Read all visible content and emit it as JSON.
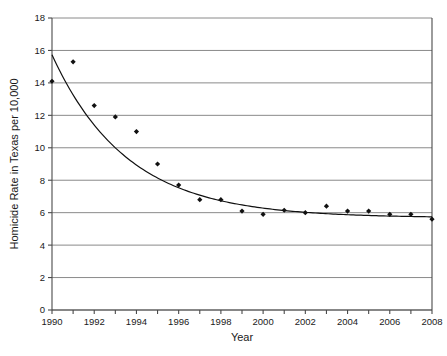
{
  "chart_data": {
    "type": "scatter",
    "title": "",
    "xlabel": "Year",
    "ylabel": "Homicide Rate in Texas per 10,000",
    "xlim": [
      1990,
      2008
    ],
    "ylim": [
      0,
      18
    ],
    "ytick_step": 2,
    "xtick_label_step": 2,
    "xtick_step": 1,
    "grid": "horizontal",
    "legend": "none",
    "x": [
      1990,
      1991,
      1992,
      1993,
      1994,
      1995,
      1996,
      1997,
      1998,
      1999,
      2000,
      2001,
      2002,
      2003,
      2004,
      2005,
      2006,
      2007,
      2008
    ],
    "values": [
      14.1,
      15.3,
      12.6,
      11.9,
      11.0,
      9.0,
      7.7,
      6.8,
      6.8,
      6.1,
      5.9,
      6.15,
      6.0,
      6.4,
      6.1,
      6.1,
      5.9,
      5.9,
      5.6
    ],
    "series": [
      {
        "name": "Homicide rate data points",
        "marker": "diamond",
        "color": "#111111",
        "values": [
          14.1,
          15.3,
          12.6,
          11.9,
          11.0,
          9.0,
          7.7,
          6.8,
          6.8,
          6.1,
          5.9,
          6.15,
          6.0,
          6.4,
          6.1,
          6.1,
          5.9,
          5.9,
          5.6
        ]
      },
      {
        "name": "Fitted exponential decay curve",
        "type": "line",
        "color": "#111111",
        "model": "y = 5.68 + 10.05 * exp(-(year-1990)/3.55)",
        "values": [
          15.73,
          13.25,
          11.39,
          9.99,
          8.93,
          8.14,
          7.54,
          7.09,
          6.75,
          6.49,
          6.3,
          6.15,
          6.04,
          5.96,
          5.89,
          5.85,
          5.81,
          5.78,
          5.76
        ]
      }
    ],
    "ytick_labels": [
      "0",
      "2",
      "4",
      "6",
      "8",
      "10",
      "12",
      "14",
      "16",
      "18"
    ],
    "xtick_labels": [
      "1990",
      "1992",
      "1994",
      "1996",
      "1998",
      "2000",
      "2002",
      "2004",
      "2006",
      "2008"
    ],
    "colors": {
      "gridline": "#8a8a8a",
      "axis": "#4a4a4a",
      "marker": "#111111",
      "curve": "#111111",
      "background": "#ffffff",
      "text": "#1a1a1a"
    }
  }
}
